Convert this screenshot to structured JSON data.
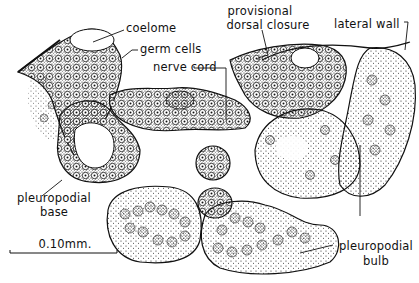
{
  "figure": {
    "type": "anatomical cross-section drawing",
    "labels": {
      "coelome": "coelome",
      "germ_cells": "germ cells",
      "nerve_cord": "nerve cord",
      "provisional_dorsal_closure_line1": "provisional",
      "provisional_dorsal_closure_line2": "dorsal closure",
      "lateral_wall": "lateral wall",
      "pleuropodial_base_line1": "pleuropodial",
      "pleuropodial_base_line2": "base",
      "pleuropodial_bulb_line1": "pleuropodial",
      "pleuropodial_bulb_line2": "bulb"
    },
    "scale_bar": {
      "label": "0.10mm."
    }
  }
}
